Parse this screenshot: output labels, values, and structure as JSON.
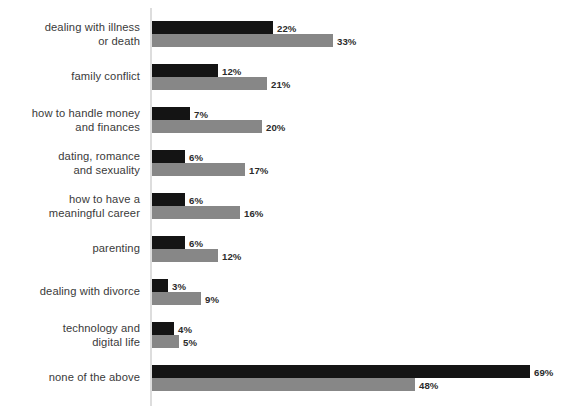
{
  "chart_data": {
    "type": "bar",
    "orientation": "horizontal",
    "title": "",
    "subtitle": "",
    "xlabel": "",
    "ylabel": "",
    "xlim": [
      0,
      69
    ],
    "grid": false,
    "legend": null,
    "value_suffix": "%",
    "categories": [
      "dealing with illness\nor death",
      "family conflict",
      "how to handle money\nand finances",
      "dating, romance\nand sexuality",
      "how to have a\nmeaningful career",
      "parenting",
      "dealing with divorce",
      "technology and\ndigital life",
      "none of the above"
    ],
    "series": [
      {
        "name": "series-a",
        "color": "#141414",
        "values": [
          22,
          12,
          7,
          6,
          6,
          6,
          3,
          4,
          69
        ],
        "labels": [
          "22%",
          "12%",
          "7%",
          "6%",
          "6%",
          "6%",
          "3%",
          "4%",
          "69%"
        ]
      },
      {
        "name": "series-b",
        "color": "#878787",
        "values": [
          33,
          21,
          20,
          17,
          16,
          12,
          9,
          5,
          48
        ],
        "labels": [
          "33%",
          "21%",
          "20%",
          "17%",
          "16%",
          "12%",
          "9%",
          "5%",
          "48%"
        ]
      }
    ]
  },
  "axis": {
    "line_color": "#dddddd"
  }
}
